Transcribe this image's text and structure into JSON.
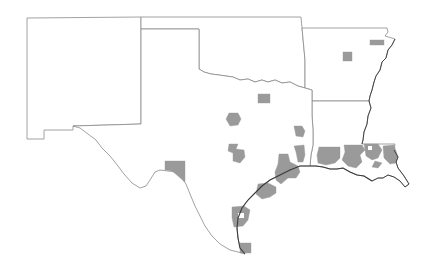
{
  "map": {
    "type": "choropleth",
    "region": "South Central United States",
    "states": [
      "New Mexico",
      "Oklahoma",
      "Arkansas",
      "Texas",
      "Louisiana"
    ],
    "colors": {
      "background": "#ffffff",
      "state_fill": "#ffffff",
      "state_border": "#8a8a8a",
      "highlighted_county": "#9a9a9a",
      "coastline": "#3a3a3a"
    },
    "highlighted_county_count": 22
  }
}
